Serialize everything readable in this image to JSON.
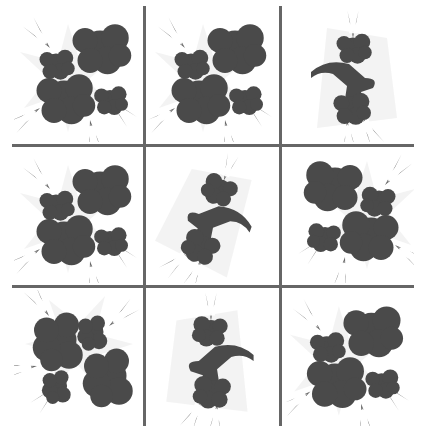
{
  "puzzle": {
    "type": "3x3 image grid",
    "colors": {
      "grid_line": "#666666",
      "smoke": "#4a4a4a",
      "haze": "#e6e6e6",
      "background": "#ffffff"
    },
    "cells": [
      {
        "row": 0,
        "col": 0,
        "variant": "burst-four-clouds",
        "icon": "explosion-icon"
      },
      {
        "row": 0,
        "col": 1,
        "variant": "burst-four-clouds",
        "icon": "explosion-icon"
      },
      {
        "row": 0,
        "col": 2,
        "variant": "smoke-trail-vertical",
        "icon": "smoke-trail-icon"
      },
      {
        "row": 1,
        "col": 0,
        "variant": "burst-four-clouds",
        "icon": "explosion-icon"
      },
      {
        "row": 1,
        "col": 1,
        "variant": "smoke-trail-diagonal",
        "icon": "smoke-trail-icon"
      },
      {
        "row": 1,
        "col": 2,
        "variant": "burst-merged-clouds",
        "icon": "explosion-icon"
      },
      {
        "row": 2,
        "col": 0,
        "variant": "burst-rotated",
        "icon": "explosion-icon"
      },
      {
        "row": 2,
        "col": 1,
        "variant": "smoke-trail-flipped",
        "icon": "smoke-trail-icon"
      },
      {
        "row": 2,
        "col": 2,
        "variant": "burst-four-clouds",
        "icon": "explosion-icon"
      }
    ]
  }
}
